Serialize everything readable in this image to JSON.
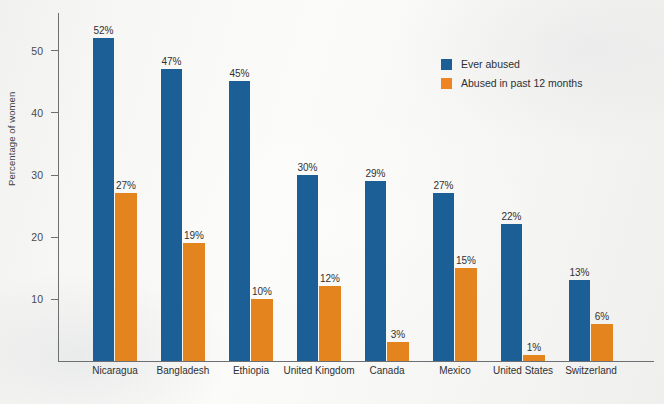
{
  "chart_data": {
    "type": "bar",
    "title": "",
    "subtitle": "",
    "xlabel": "",
    "ylabel": "Percentage of women",
    "ylim": [
      0,
      56
    ],
    "yticks": [
      10,
      20,
      30,
      40,
      50
    ],
    "ytick_labels": [
      "10",
      "20",
      "30",
      "40",
      "50"
    ],
    "grid": false,
    "legend_position": "upper-right",
    "categories": [
      "Nicaragua",
      "Bangladesh",
      "Ethiopia",
      "United Kingdom",
      "Canada",
      "Mexico",
      "United States",
      "Switzerland"
    ],
    "series": [
      {
        "name": "Ever abused",
        "color": "#1c5e96",
        "values": [
          52,
          47,
          45,
          30,
          29,
          27,
          22,
          13
        ],
        "value_labels": [
          "52%",
          "47%",
          "45%",
          "30%",
          "29%",
          "27%",
          "22%",
          "13%"
        ]
      },
      {
        "name": "Abused in past 12 months",
        "color": "#e4841f",
        "values": [
          27,
          19,
          10,
          12,
          3,
          15,
          1,
          6
        ],
        "value_labels": [
          "27%",
          "19%",
          "10%",
          "12%",
          "3%",
          "15%",
          "1%",
          "6%"
        ]
      }
    ]
  },
  "legend": {
    "items": [
      {
        "label": "Ever abused",
        "color": "#1c5e96",
        "swatch": "legend-swatch-blue"
      },
      {
        "label": "Abused in past 12 months",
        "color": "#e4841f",
        "swatch": "legend-swatch-orange"
      }
    ]
  }
}
